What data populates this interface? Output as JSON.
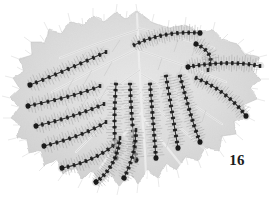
{
  "plate": {
    "figure_number": "16",
    "caption": "",
    "background_color": "#ffffff",
    "ink_color": "#1b1b1b",
    "leaf_fill_color": "#e9e9e9",
    "leaf_shadow_color": "#cfcfcf",
    "leaf_vein_color": "#ffffff",
    "caterpillar_body_color": "#151515",
    "caterpillar_hair_color": "#8d8d8d",
    "subject": "caterpillar-colony-on-leaf",
    "media": "halftone-photograph",
    "caterpillar_count": 16
  },
  "leaf": {
    "name": "host-leaf",
    "outline_points": "137,11 152,22 168,28 185,25 199,33 213,30 222,40 238,44 246,54 259,57 252,70 261,79 250,88 257,99 243,105 247,117 234,121 236,134 222,136 219,150 205,148 198,160 186,157 177,170 166,164 158,178 147,170 138,184 129,172 119,186 110,173 100,184 92,170 82,180 74,166 63,174 57,160 45,165 41,151 29,153 27,139 16,138 21,125 11,118 19,107 10,98 20,89 13,78 24,71 19,59 32,55 31,42 45,42 48,30 62,33 70,21 83,26 93,16 104,22 116,12 126,19",
    "veins": [
      {
        "name": "midrib",
        "path": "M137,14 L139,60 L141,96 L143,128"
      },
      {
        "name": "vein-left-1",
        "path": "M138,30 L96,44 L60,58"
      },
      {
        "name": "vein-left-2",
        "path": "M139,48 L90,72 L52,92"
      },
      {
        "name": "vein-left-3",
        "path": "M140,70 L96,100 L58,128"
      },
      {
        "name": "vein-left-4",
        "path": "M141,92 L104,124 L76,152"
      },
      {
        "name": "vein-left-5",
        "path": "M142,112 L118,142 L100,168"
      },
      {
        "name": "vein-right-1",
        "path": "M138,28 L178,38 L214,48"
      },
      {
        "name": "vein-right-2",
        "path": "M139,50 L186,66 L226,82"
      },
      {
        "name": "vein-right-3",
        "path": "M141,74 L186,100 L222,124"
      },
      {
        "name": "vein-right-4",
        "path": "M142,98 L178,126 L206,150"
      },
      {
        "name": "vein-right-5",
        "path": "M143,118 L166,146 L182,166"
      },
      {
        "name": "vein-center",
        "path": "M143,124 L145,152 L146,176"
      }
    ]
  },
  "caterpillars": [
    {
      "id": 1,
      "name": "caterpillar-upper-center",
      "path": "M134,45 C152,36 176,31 200,33",
      "segments": 13,
      "head_at": "end"
    },
    {
      "id": 2,
      "name": "caterpillar-upper-right",
      "path": "M196,44 C210,50 214,60 208,70",
      "segments": 7,
      "head_at": "start"
    },
    {
      "id": 3,
      "name": "caterpillar-right-upper",
      "path": "M188,67 C214,62 240,62 260,66",
      "segments": 14,
      "head_at": "start"
    },
    {
      "id": 4,
      "name": "caterpillar-right-mid",
      "path": "M196,78 C216,86 234,100 246,116",
      "segments": 12,
      "head_at": "end"
    },
    {
      "id": 5,
      "name": "caterpillar-right-lower",
      "path": "M180,76 C186,98 192,122 200,142",
      "segments": 13,
      "head_at": "end"
    },
    {
      "id": 6,
      "name": "caterpillar-center-right-a",
      "path": "M166,76 C170,100 174,124 178,148",
      "segments": 13,
      "head_at": "end"
    },
    {
      "id": 7,
      "name": "caterpillar-center-right-b",
      "path": "M150,84 C152,108 154,132 156,158",
      "segments": 14,
      "head_at": "end"
    },
    {
      "id": 8,
      "name": "caterpillar-center-left-a",
      "path": "M130,84 C131,110 133,134 136,160",
      "segments": 14,
      "head_at": "end"
    },
    {
      "id": 9,
      "name": "caterpillar-center-left-b",
      "path": "M116,84 C114,110 114,134 116,158",
      "segments": 13,
      "head_at": "end"
    },
    {
      "id": 10,
      "name": "caterpillar-left-upper",
      "path": "M30,85 C58,74 84,62 106,52",
      "segments": 13,
      "head_at": "start"
    },
    {
      "id": 11,
      "name": "caterpillar-left-mid-a",
      "path": "M28,106 C56,100 82,94 100,86",
      "segments": 12,
      "head_at": "start"
    },
    {
      "id": 12,
      "name": "caterpillar-left-mid-b",
      "path": "M36,126 C62,120 86,112 104,104",
      "segments": 12,
      "head_at": "start"
    },
    {
      "id": 13,
      "name": "caterpillar-left-lower-a",
      "path": "M44,146 C68,140 90,132 106,122",
      "segments": 11,
      "head_at": "start"
    },
    {
      "id": 14,
      "name": "caterpillar-left-lower-b",
      "path": "M62,168 C84,164 104,154 118,142",
      "segments": 11,
      "head_at": "start"
    },
    {
      "id": 15,
      "name": "caterpillar-bottom-left",
      "path": "M96,182 C110,172 118,156 120,138",
      "segments": 11,
      "head_at": "start"
    },
    {
      "id": 16,
      "name": "caterpillar-bottom-center",
      "path": "M124,178 C132,162 136,146 136,130",
      "segments": 10,
      "head_at": "start"
    }
  ]
}
